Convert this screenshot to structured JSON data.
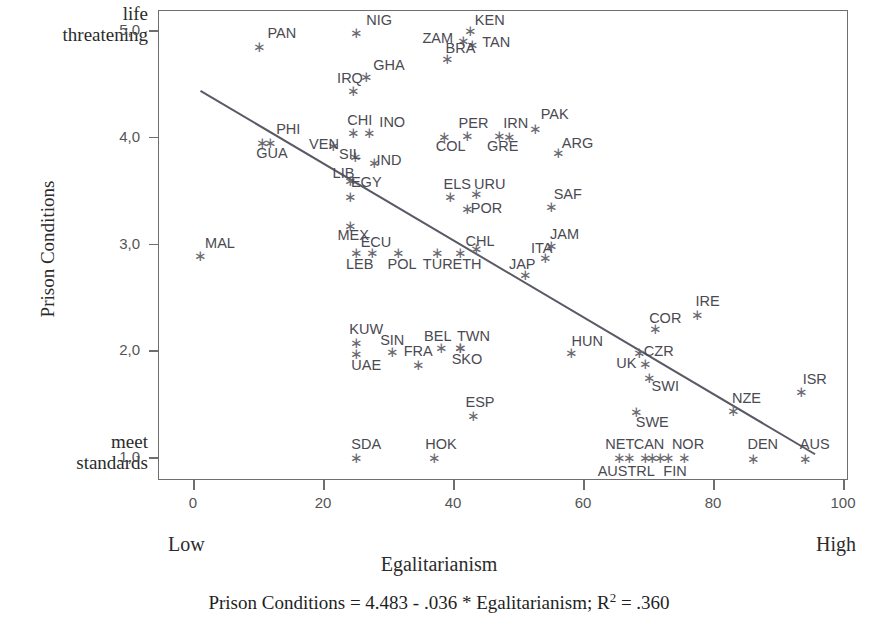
{
  "axes": {
    "y_title": "Prison Conditions",
    "y_top_anchor_line1": "life",
    "y_top_anchor_line2": "threatening",
    "y_bottom_anchor_line1": "meet",
    "y_bottom_anchor_line2": "standards",
    "y_ticks": [
      "5,0",
      "4,0",
      "3,0",
      "2,0",
      "1,0"
    ],
    "x_title": "Egalitarianism",
    "x_ticks": [
      "0",
      "20",
      "40",
      "60",
      "80",
      "100"
    ],
    "x_low_anchor": "Low",
    "x_high_anchor": "High"
  },
  "caption": {
    "prefix": "Prison Conditions = 4.483 - .036 * Egalitarianism; R",
    "sup": "2",
    "suffix": " = .360"
  },
  "colors": {
    "axis": "#6e6e6e",
    "marker": "#6b6b74",
    "label": "#4a4a52",
    "regression_line": "#5a5a66",
    "text": "#2b2b2b"
  },
  "chart_data": {
    "type": "scatter",
    "title": "",
    "xlabel": "Egalitarianism",
    "ylabel": "Prison Conditions",
    "xlim": [
      -3,
      101
    ],
    "ylim": [
      0.78,
      5.2
    ],
    "grid": false,
    "legend": "none",
    "annotation": "Prison Conditions = 4.483 - .036 * Egalitarianism; R2 = .360",
    "regression": {
      "intercept": 4.483,
      "slope": -0.036,
      "r_squared": 0.36,
      "x_start": 1.0,
      "x_end": 95.5
    },
    "points": [
      {
        "label": "PAN",
        "x": 10.0,
        "y": 4.86,
        "lx": 13.5,
        "ly": 4.98
      },
      {
        "label": "NIG",
        "x": 25.0,
        "y": 4.99,
        "lx": 28.5,
        "ly": 5.1
      },
      {
        "label": "ZAM",
        "x": 41.5,
        "y": 4.92,
        "lx": 37.5,
        "ly": 4.93
      },
      {
        "label": "KEN",
        "x": 42.5,
        "y": 5.01,
        "lx": 45.5,
        "ly": 5.1
      },
      {
        "label": "TAN",
        "x": 42.8,
        "y": 4.88,
        "lx": 46.5,
        "ly": 4.9
      },
      {
        "label": "BRA",
        "x": 39.0,
        "y": 4.75,
        "lx": 41.0,
        "ly": 4.84
      },
      {
        "label": "GHA",
        "x": 26.5,
        "y": 4.58,
        "lx": 30.0,
        "ly": 4.68
      },
      {
        "label": "IRQ",
        "x": 24.5,
        "y": 4.45,
        "lx": 24.0,
        "ly": 4.56
      },
      {
        "label": "CHI",
        "x": 24.5,
        "y": 4.05,
        "lx": 25.5,
        "ly": 4.17
      },
      {
        "label": "INO",
        "x": 27.0,
        "y": 4.05,
        "lx": 30.5,
        "ly": 4.15
      },
      {
        "label": "PHI",
        "x": 10.5,
        "y": 3.96,
        "lx": 14.5,
        "ly": 4.08
      },
      {
        "label": "GUA",
        "x": 11.8,
        "y": 3.96,
        "lx": 12.0,
        "ly": 3.86
      },
      {
        "label": "PER",
        "x": 42.0,
        "y": 4.03,
        "lx": 43.0,
        "ly": 4.14
      },
      {
        "label": "IRN",
        "x": 47.0,
        "y": 4.03,
        "lx": 49.5,
        "ly": 4.14
      },
      {
        "label": "PAK",
        "x": 52.5,
        "y": 4.09,
        "lx": 55.5,
        "ly": 4.22
      },
      {
        "label": "COL",
        "x": 38.5,
        "y": 4.02,
        "lx": 39.5,
        "ly": 3.92
      },
      {
        "label": "GRE",
        "x": 48.5,
        "y": 4.02,
        "lx": 47.5,
        "ly": 3.92
      },
      {
        "label": "VEN",
        "x": 21.5,
        "y": 3.93,
        "lx": 20.0,
        "ly": 3.94
      },
      {
        "label": "SIL",
        "x": 24.8,
        "y": 3.83,
        "lx": 24.0,
        "ly": 3.85
      },
      {
        "label": "IND",
        "x": 27.8,
        "y": 3.77,
        "lx": 30.0,
        "ly": 3.79
      },
      {
        "label": "ARG",
        "x": 56.0,
        "y": 3.87,
        "lx": 59.0,
        "ly": 3.95
      },
      {
        "label": "LIB",
        "x": 24.0,
        "y": 3.6,
        "lx": 23.0,
        "ly": 3.67
      },
      {
        "label": "EGY",
        "x": 24.0,
        "y": 3.45,
        "lx": 26.5,
        "ly": 3.59
      },
      {
        "label": "ELS",
        "x": 39.5,
        "y": 3.45,
        "lx": 40.5,
        "ly": 3.57
      },
      {
        "label": "URU",
        "x": 43.5,
        "y": 3.48,
        "lx": 45.5,
        "ly": 3.57
      },
      {
        "label": "POR",
        "x": 42.0,
        "y": 3.34,
        "lx": 45.0,
        "ly": 3.34
      },
      {
        "label": "SAF",
        "x": 55.0,
        "y": 3.36,
        "lx": 57.5,
        "ly": 3.47
      },
      {
        "label": "MEX",
        "x": 24.0,
        "y": 3.18,
        "lx": 24.5,
        "ly": 3.09
      },
      {
        "label": "ECU",
        "x": 27.5,
        "y": 2.93,
        "lx": 28.0,
        "ly": 3.02
      },
      {
        "label": "CHL",
        "x": 43.5,
        "y": 2.97,
        "lx": 44.0,
        "ly": 3.03
      },
      {
        "label": "JAM",
        "x": 55.0,
        "y": 3.0,
        "lx": 57.0,
        "ly": 3.1
      },
      {
        "label": "MAL",
        "x": 1.0,
        "y": 2.9,
        "lx": 4.0,
        "ly": 3.01
      },
      {
        "label": "LEB",
        "x": 25.0,
        "y": 2.93,
        "lx": 25.5,
        "ly": 2.82
      },
      {
        "label": "POL",
        "x": 31.5,
        "y": 2.93,
        "lx": 32.0,
        "ly": 2.82
      },
      {
        "label": "TUR",
        "x": 37.5,
        "y": 2.93,
        "lx": 37.5,
        "ly": 2.82
      },
      {
        "label": "ETH",
        "x": 41.0,
        "y": 2.93,
        "lx": 42.0,
        "ly": 2.82
      },
      {
        "label": "ITA",
        "x": 54.0,
        "y": 2.88,
        "lx": 53.5,
        "ly": 2.97
      },
      {
        "label": "JAP",
        "x": 51.0,
        "y": 2.72,
        "lx": 50.5,
        "ly": 2.82
      },
      {
        "label": "IRE",
        "x": 77.5,
        "y": 2.35,
        "lx": 79.0,
        "ly": 2.47
      },
      {
        "label": "COR",
        "x": 71.0,
        "y": 2.22,
        "lx": 72.5,
        "ly": 2.31
      },
      {
        "label": "KUW",
        "x": 25.0,
        "y": 2.09,
        "lx": 26.5,
        "ly": 2.21
      },
      {
        "label": "SIN",
        "x": 30.5,
        "y": 2.0,
        "lx": 30.5,
        "ly": 2.11
      },
      {
        "label": "BEL",
        "x": 38.0,
        "y": 2.04,
        "lx": 37.5,
        "ly": 2.14
      },
      {
        "label": "TWN",
        "x": 41.0,
        "y": 2.04,
        "lx": 43.0,
        "ly": 2.14
      },
      {
        "label": "HUN",
        "x": 58.0,
        "y": 1.99,
        "lx": 60.5,
        "ly": 2.1
      },
      {
        "label": "UAE",
        "x": 25.0,
        "y": 1.98,
        "lx": 26.5,
        "ly": 1.87
      },
      {
        "label": "FRA",
        "x": 34.5,
        "y": 1.88,
        "lx": 34.5,
        "ly": 2.0
      },
      {
        "label": "SKO",
        "x": 41.0,
        "y": 2.04,
        "lx": 42.0,
        "ly": 1.93
      },
      {
        "label": "CZR",
        "x": 68.5,
        "y": 1.99,
        "lx": 71.5,
        "ly": 2.0
      },
      {
        "label": "UK",
        "x": 69.5,
        "y": 1.89,
        "lx": 66.5,
        "ly": 1.89
      },
      {
        "label": "SWI",
        "x": 70.0,
        "y": 1.76,
        "lx": 72.5,
        "ly": 1.67
      },
      {
        "label": "ISR",
        "x": 93.5,
        "y": 1.63,
        "lx": 95.5,
        "ly": 1.74
      },
      {
        "label": "NZE",
        "x": 83.0,
        "y": 1.45,
        "lx": 85.0,
        "ly": 1.56
      },
      {
        "label": "SWE",
        "x": 68.0,
        "y": 1.44,
        "lx": 70.5,
        "ly": 1.34
      },
      {
        "label": "ESP",
        "x": 43.0,
        "y": 1.4,
        "lx": 44.0,
        "ly": 1.52
      },
      {
        "label": "SDA",
        "x": 25.0,
        "y": 1.01,
        "lx": 26.5,
        "ly": 1.13
      },
      {
        "label": "HOK",
        "x": 37.0,
        "y": 1.01,
        "lx": 38.0,
        "ly": 1.13
      },
      {
        "label": "NET",
        "x": 65.5,
        "y": 1.01,
        "lx": 65.5,
        "ly": 1.13
      },
      {
        "label": "CAN",
        "x": 67.0,
        "y": 1.01,
        "lx": 70.0,
        "ly": 1.13
      },
      {
        "label": "AUSTRL",
        "x": 69.5,
        "y": 1.01,
        "lx": 66.5,
        "ly": 0.88
      },
      {
        "label": "NOR",
        "x": 73.0,
        "y": 1.01,
        "lx": 76.0,
        "ly": 1.13
      },
      {
        "label": "FIN",
        "x": 75.5,
        "y": 1.01,
        "lx": 74.0,
        "ly": 0.88
      },
      {
        "label": "DEN",
        "x": 86.0,
        "y": 1.0,
        "lx": 87.5,
        "ly": 1.13
      },
      {
        "label": "AUS",
        "x": 94.0,
        "y": 1.0,
        "lx": 95.5,
        "ly": 1.13
      }
    ],
    "extra_markers": [
      {
        "x": 70.5,
        "y": 1.01
      },
      {
        "x": 71.8,
        "y": 1.01
      }
    ]
  }
}
